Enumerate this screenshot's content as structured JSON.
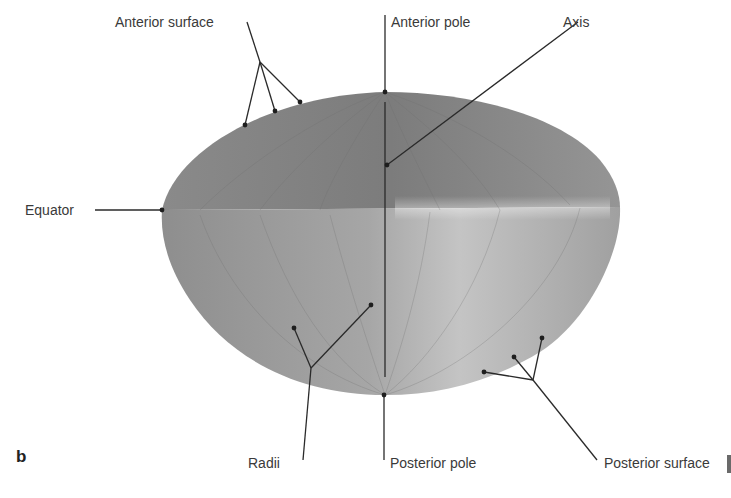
{
  "figure": {
    "panel_letter": "b",
    "colors": {
      "background": "#ffffff",
      "lens_dark": "#7f7f7f",
      "lens_mid": "#9c9c9c",
      "lens_light": "#c9c9c9",
      "leader_line": "#2a2a2a",
      "label_text": "#3a3a3a"
    },
    "labels": {
      "anterior_surface": "Anterior surface",
      "anterior_pole": "Anterior pole",
      "axis": "Axis",
      "equator": "Equator",
      "radii": "Radii",
      "posterior_pole": "Posterior pole",
      "posterior_surface": "Posterior surface"
    }
  }
}
